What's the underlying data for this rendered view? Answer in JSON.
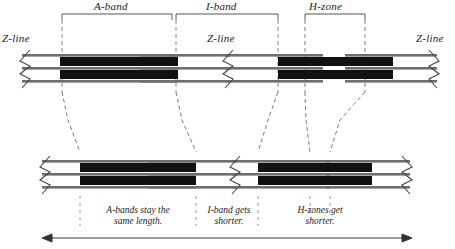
{
  "figure": {
    "colors": {
      "thick_filament": "#111111",
      "thin_filament": "#6e6e6e",
      "outline": "#444444",
      "dashed": "#555555",
      "background": "#ffffff"
    }
  },
  "top_labels": {
    "a_band": "A-band",
    "i_band": "I-band",
    "h_zone": "H-zone",
    "z_line_left": "Z-line",
    "z_line_middle": "Z-line",
    "z_line_right": "Z-line"
  },
  "captions": {
    "a_band_note_line1": "A-bands stay the",
    "a_band_note_line2": "same length.",
    "i_band_note_line1": "I-band gets",
    "i_band_note_line2": "shorter.",
    "h_zone_note_line1": "H-zones get",
    "h_zone_note_line2": "shorter."
  },
  "relaxed_sarcomere": {
    "name": "relaxed-myofibril",
    "z_lines_x": [
      22,
      225,
      435
    ],
    "thick_filaments": [
      {
        "x1": 60,
        "x2": 178
      },
      {
        "x1": 278,
        "x2": 393
      }
    ],
    "h_zone_span": {
      "x1": 305,
      "x2": 365
    },
    "a_band_span": {
      "x1": 62,
      "x2": 172
    },
    "i_band_span": {
      "x1": 172,
      "x2": 278
    }
  },
  "contracted_sarcomere": {
    "name": "contracted-myofibril",
    "z_lines_x": [
      42,
      232,
      408
    ],
    "thick_filaments": [
      {
        "x1": 80,
        "x2": 196
      },
      {
        "x1": 258,
        "x2": 372
      }
    ],
    "h_zone_span": {
      "x1": 310,
      "x2": 330
    }
  },
  "scale_arrow": {
    "name": "length-arrow",
    "x1": 42,
    "x2": 412,
    "y": 238,
    "double_headed": true
  }
}
